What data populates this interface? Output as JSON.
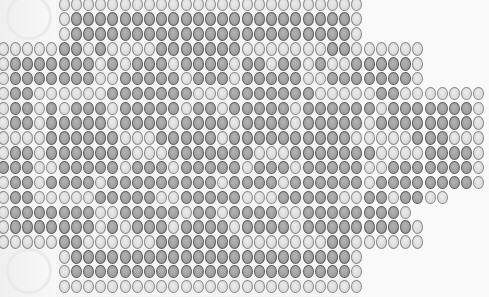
{
  "board": {
    "col_pitch": 12.2,
    "row_pitch": 14.85,
    "x_offset": -3,
    "y_offset": -3,
    "colors": {
      "light": "#dcdcdc",
      "dark": "#9e9e9e",
      "outline": "#6f6f6f",
      "background": "#f4f4f4"
    },
    "rows": [
      {
        "start": 5,
        "cells": "LLLLLLLLLLLLLLLLLLLLLLLLL"
      },
      {
        "start": 5,
        "cells": "LDDDDDDDDDDDDDDDDDDDDDDDL"
      },
      {
        "start": 5,
        "cells": "LDDDDDDDDDDDDDDDDDDDDDDDL"
      },
      {
        "start": 0,
        "cells": "LLLLLDDLDLLLLDDDDDDDLLLLLLLDDLLLLLL"
      },
      {
        "start": 0,
        "cells": "LDDDDDDDLDLDDDLDDDDLDDLDDLDLLDDDDDL"
      },
      {
        "start": 0,
        "cells": "LDDDDDDDLLDDDDDLDDDLDDDDDLLDDDDDDDL"
      },
      {
        "start": 0,
        "cells": "LDDLLLLLLDDDDDDDLLLDDDDDDDLLLLLDDLLLLLLL"
      },
      {
        "start": 0,
        "cells": "LDDLDLDDDLDDDDDLDDLDDDDDLDDDDDDLDDDDDDDL"
      },
      {
        "start": 0,
        "cells": "LDDLDDDDDLDDDDLDDDDLDDDDLDDDDDLDDDDDDDDL"
      },
      {
        "start": 0,
        "cells": "LLLLDDDDDDLLLDDDDDLDDDDDDDDDDLLLLLDDDLLL"
      },
      {
        "start": 0,
        "cells": "LDDLDDDDDDDLLLDDDDDDDLLLDDDDDDDLLLLDDDDL"
      },
      {
        "start": 0,
        "cells": "DDDLLDDDDDLDDDLDDDDDLDDDLDDDDDLLDDDDDDDL"
      },
      {
        "start": 0,
        "cells": "LDDLDDDDLDDDDDDDDDLDDDDLDDDDDDLDDDDDDDDL"
      },
      {
        "start": 0,
        "cells": "LDDLLLLLDDDDDLLDDDDDLLLDDDDDLLDDLDDLL"
      },
      {
        "start": 0,
        "cells": "LDDDDDDDLLDDDDDLDDLDDDDLLDDDDDDDDL"
      },
      {
        "start": 0,
        "cells": "LDDDDDDDLDLDDDLDDDDLDDDDLDDDDDDDDDL"
      },
      {
        "start": 0,
        "cells": "LLLLLDDLLLLLLDDDDDDDLLLLLLLDDLLLLLL"
      },
      {
        "start": 5,
        "cells": "LDDDDDDDDDDDDDDDDDDDDDDDL"
      },
      {
        "start": 5,
        "cells": "LDDDDDDDDDDDDDDDDDDDDDDDL"
      },
      {
        "start": 5,
        "cells": "LLLLLLLLLLLLLLLLLLLLLLLLL"
      }
    ]
  }
}
